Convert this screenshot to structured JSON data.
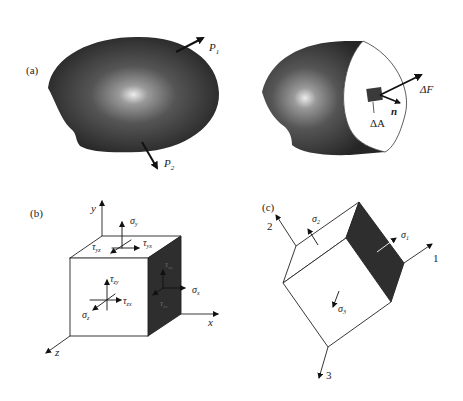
{
  "panels": {
    "a": {
      "label": "(a)",
      "left_body": {
        "forces": [
          {
            "name": "P",
            "sub": "1"
          },
          {
            "name": "P",
            "sub": "2"
          }
        ]
      },
      "right_body": {
        "area_label": "ΔA",
        "force_label": "ΔF",
        "normal_label": "n"
      }
    },
    "b": {
      "label": "(b)",
      "axes": {
        "x": "x",
        "y": "y",
        "z": "z"
      },
      "top_face": {
        "normal": "σ",
        "normal_sub": "y",
        "shear1": "τ",
        "shear1_sub": "yz",
        "shear2": "τ",
        "shear2_sub": "yx"
      },
      "front_face": {
        "normal": "σ",
        "normal_sub": "z",
        "shear1": "τ",
        "shear1_sub": "zy",
        "shear2": "τ",
        "shear2_sub": "zx"
      },
      "side_face": {
        "normal": "σ",
        "normal_sub": "x",
        "shear1": "τ",
        "shear1_sub": "xy",
        "shear2": "τ",
        "shear2_sub": "xz"
      }
    },
    "c": {
      "label": "(c)",
      "axes": {
        "one": "1",
        "two": "2",
        "three": "3"
      },
      "stresses": [
        {
          "name": "σ",
          "sub": "1"
        },
        {
          "name": "σ",
          "sub": "2"
        },
        {
          "name": "σ",
          "sub": "3"
        }
      ]
    }
  },
  "colors": {
    "body_dark": "#2b2b2b",
    "body_light": "#e8e8e8",
    "line": "#222222",
    "background": "#ffffff"
  }
}
